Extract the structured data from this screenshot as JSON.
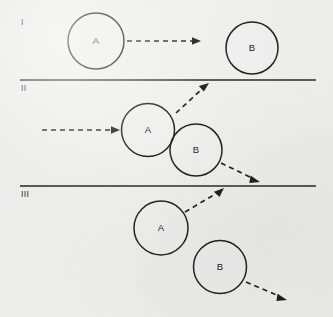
{
  "figure": {
    "width": 333,
    "height": 317,
    "background_color": "#efefed",
    "stroke_color": "#1b1b1b",
    "rows": [
      {
        "id": "row-1",
        "numeral": "I",
        "numeral_x": 21,
        "numeral_y": 22,
        "caption": "Ball A moves right toward stationary ball B",
        "balls": [
          {
            "label": "A",
            "cx": 96,
            "cy": 41,
            "r": 28
          },
          {
            "label": "B",
            "cx": 252,
            "cy": 48,
            "r": 26
          }
        ],
        "arrows": [
          {
            "name": "arrow-a-incoming",
            "x1": 127,
            "y1": 41,
            "x2": 200,
            "y2": 41
          }
        ],
        "divider": {
          "x1": 20,
          "y1": 80,
          "x2": 316,
          "y2": 80
        }
      },
      {
        "id": "row-2",
        "numeral": "II",
        "numeral_x": 21,
        "numeral_y": 88,
        "caption": "Balls A and B in contact at the moment of collision",
        "balls": [
          {
            "label": "A",
            "cx": 148,
            "cy": 130,
            "r": 26.5
          },
          {
            "label": "B",
            "cx": 196,
            "cy": 150,
            "r": 26
          }
        ],
        "arrows": [
          {
            "name": "arrow-a-incoming",
            "x1": 42,
            "y1": 130,
            "x2": 119,
            "y2": 130
          },
          {
            "name": "arrow-a-deflected",
            "x1": 176,
            "y1": 113,
            "x2": 208,
            "y2": 84
          },
          {
            "name": "arrow-b-deflected",
            "x1": 221,
            "y1": 163,
            "x2": 259,
            "y2": 181
          }
        ],
        "divider": {
          "x1": 20,
          "y1": 186,
          "x2": 316,
          "y2": 186
        }
      },
      {
        "id": "row-3",
        "numeral": "III",
        "numeral_x": 21,
        "numeral_y": 194,
        "caption": "Balls A and B separating along their new paths",
        "balls": [
          {
            "label": "A",
            "cx": 161,
            "cy": 228,
            "r": 27
          },
          {
            "label": "B",
            "cx": 220,
            "cy": 267,
            "r": 26.5
          }
        ],
        "arrows": [
          {
            "name": "arrow-a-outgoing",
            "x1": 185,
            "y1": 212,
            "x2": 223,
            "y2": 189
          },
          {
            "name": "arrow-b-outgoing",
            "x1": 246,
            "y1": 282,
            "x2": 286,
            "y2": 300
          }
        ],
        "divider": null
      }
    ]
  }
}
